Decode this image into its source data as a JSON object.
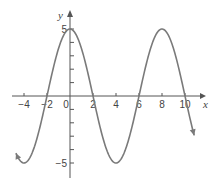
{
  "chart_data": {
    "type": "line",
    "title": "",
    "xlabel": "x",
    "ylabel": "y",
    "function": "y = 5cos(pi*x/4)",
    "xlim": [
      -4.8,
      10.8
    ],
    "ylim": [
      -5,
      5
    ],
    "x_ticks": [
      -4,
      -2,
      0,
      2,
      4,
      6,
      8,
      10
    ],
    "x_tick_labels": [
      "-4",
      "-2",
      "0",
      "2",
      "4",
      "6",
      "8",
      "10"
    ],
    "y_ticks": [
      -5,
      -4,
      -3,
      -2,
      -1,
      1,
      2,
      3,
      4,
      5
    ],
    "y_tick_labels": {
      "5": "5",
      "-5": "-5"
    },
    "grid": false,
    "legend": null,
    "series": [
      {
        "name": "curve",
        "x": [
          -4.7,
          -4,
          -3,
          -2,
          -1,
          0,
          1,
          2,
          3,
          4,
          5,
          6,
          7,
          8,
          9,
          10,
          10.8
        ],
        "y": [
          -4.77,
          -5,
          -3.54,
          0,
          3.54,
          5,
          3.54,
          0,
          -3.54,
          -5,
          -3.54,
          0,
          3.54,
          5,
          3.54,
          0,
          -3.44
        ]
      }
    ],
    "key_points": {
      "maxima": [
        [
          0,
          5
        ],
        [
          8,
          5
        ]
      ],
      "minima": [
        [
          -4,
          -5
        ],
        [
          4,
          -5
        ]
      ],
      "zeros": [
        -2,
        2,
        6,
        10
      ]
    },
    "colors": {
      "curve": "#7a7a7a",
      "axes": "#555555"
    }
  }
}
